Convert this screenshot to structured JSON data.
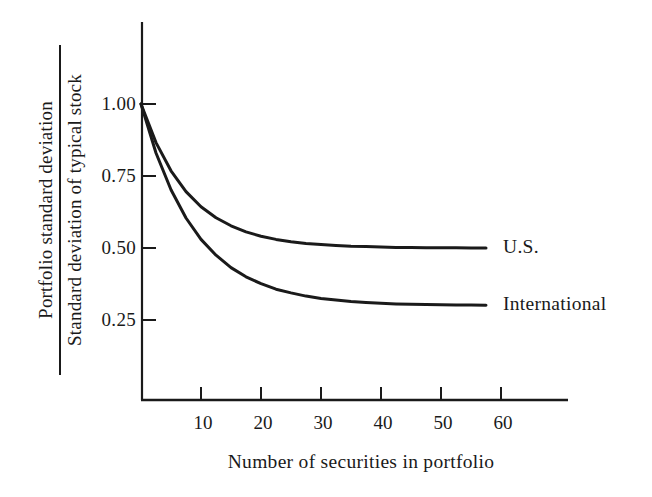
{
  "figure": {
    "background": "#ffffff",
    "ink_color": "#1a1a1a"
  },
  "chart_data": {
    "type": "line",
    "title": "",
    "xlabel": "Number of securities in portfolio",
    "ylabel_numerator": "Portfolio standard deviation",
    "ylabel_denominator": "Standard deviation of typical stock",
    "x_ticks": [
      10,
      20,
      30,
      40,
      50,
      60
    ],
    "y_ticks": [
      {
        "label": "1.00",
        "value": 1.0
      },
      {
        "label": "0.75",
        "value": 0.75
      },
      {
        "label": "0.50",
        "value": 0.5
      },
      {
        "label": "0.25",
        "value": 0.25
      }
    ],
    "xlim": [
      0,
      71
    ],
    "ylim": [
      0,
      1.28
    ],
    "grid": false,
    "legend_position": "labels-at-curve-ends",
    "x": [
      0,
      2.5,
      5,
      7.5,
      10,
      12.5,
      15,
      17.5,
      20,
      22.5,
      25,
      27.5,
      30,
      32.5,
      35,
      37.5,
      40,
      42.5,
      45,
      47.5,
      50,
      52.5,
      55,
      57.5
    ],
    "series": [
      {
        "name": "U.S.",
        "asymptote": 0.5,
        "values": [
          1.0,
          0.866,
          0.768,
          0.696,
          0.643,
          0.605,
          0.577,
          0.556,
          0.541,
          0.53,
          0.522,
          0.516,
          0.512,
          0.509,
          0.506,
          0.505,
          0.503,
          0.502,
          0.502,
          0.501,
          0.501,
          0.501,
          0.5,
          0.5
        ]
      },
      {
        "name": "International",
        "asymptote": 0.3,
        "values": [
          1.0,
          0.83,
          0.702,
          0.604,
          0.53,
          0.475,
          0.432,
          0.4,
          0.376,
          0.357,
          0.344,
          0.333,
          0.325,
          0.319,
          0.314,
          0.311,
          0.308,
          0.306,
          0.305,
          0.304,
          0.303,
          0.302,
          0.302,
          0.301
        ]
      }
    ]
  }
}
